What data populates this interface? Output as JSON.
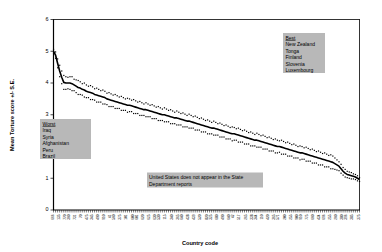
{
  "chart_data": {
    "type": "line",
    "title": "",
    "xlabel": "Country code",
    "ylabel": "Mean Torture score +/- S.E.",
    "ylim": [
      0,
      6
    ],
    "yticks": [
      0,
      1,
      2,
      3,
      4,
      5,
      6
    ],
    "grid": false,
    "legend": "none",
    "series": [
      {
        "name": "Mean Torture score",
        "values": [
          5.0,
          4.88,
          4.62,
          4.38,
          4.18,
          4.02,
          4.0,
          4.0,
          4.0,
          3.98,
          3.94,
          3.9,
          3.86,
          3.84,
          3.8,
          3.78,
          3.74,
          3.72,
          3.7,
          3.68,
          3.64,
          3.62,
          3.6,
          3.58,
          3.56,
          3.54,
          3.5,
          3.48,
          3.46,
          3.44,
          3.42,
          3.4,
          3.38,
          3.36,
          3.34,
          3.32,
          3.3,
          3.3,
          3.28,
          3.26,
          3.24,
          3.22,
          3.2,
          3.18,
          3.16,
          3.16,
          3.14,
          3.12,
          3.1,
          3.08,
          3.06,
          3.04,
          3.02,
          3.0,
          3.0,
          2.98,
          2.96,
          2.94,
          2.92,
          2.9,
          2.9,
          2.88,
          2.86,
          2.84,
          2.82,
          2.8,
          2.8,
          2.78,
          2.76,
          2.74,
          2.72,
          2.7,
          2.68,
          2.66,
          2.64,
          2.62,
          2.6,
          2.58,
          2.58,
          2.56,
          2.54,
          2.52,
          2.5,
          2.48,
          2.46,
          2.44,
          2.42,
          2.4,
          2.4,
          2.38,
          2.36,
          2.34,
          2.32,
          2.3,
          2.28,
          2.26,
          2.24,
          2.22,
          2.2,
          2.2,
          2.18,
          2.16,
          2.14,
          2.12,
          2.1,
          2.08,
          2.06,
          2.04,
          2.02,
          2.0,
          2.0,
          1.98,
          1.96,
          1.94,
          1.92,
          1.9,
          1.88,
          1.86,
          1.84,
          1.82,
          1.8,
          1.8,
          1.78,
          1.76,
          1.74,
          1.72,
          1.7,
          1.68,
          1.66,
          1.64,
          1.62,
          1.6,
          1.58,
          1.56,
          1.54,
          1.52,
          1.5,
          1.46,
          1.42,
          1.38,
          1.3,
          1.22,
          1.16,
          1.12,
          1.1,
          1.08,
          1.06,
          1.04,
          1.0,
          0.96
        ]
      }
    ],
    "error_offsets": [
      0.06,
      0.1,
      0.14,
      0.18,
      0.2,
      0.22,
      0.2,
      0.18,
      0.2,
      0.22,
      0.18,
      0.2,
      0.22,
      0.2,
      0.18,
      0.22,
      0.2,
      0.18,
      0.22,
      0.2,
      0.18,
      0.22,
      0.2,
      0.18,
      0.22,
      0.2,
      0.18,
      0.22,
      0.2,
      0.18,
      0.22,
      0.2,
      0.18,
      0.22,
      0.2,
      0.18,
      0.22,
      0.2,
      0.18,
      0.22,
      0.2,
      0.18,
      0.22,
      0.2,
      0.18,
      0.22,
      0.2,
      0.18,
      0.22,
      0.2,
      0.18,
      0.22,
      0.2,
      0.18,
      0.22,
      0.2,
      0.18,
      0.22,
      0.2,
      0.18,
      0.22,
      0.2,
      0.18,
      0.22,
      0.2,
      0.18,
      0.22,
      0.2,
      0.18,
      0.22,
      0.2,
      0.18,
      0.22,
      0.2,
      0.18,
      0.22,
      0.2,
      0.18,
      0.22,
      0.2,
      0.18,
      0.22,
      0.2,
      0.18,
      0.22,
      0.2,
      0.18,
      0.22,
      0.2,
      0.18,
      0.22,
      0.2,
      0.18,
      0.22,
      0.2,
      0.18,
      0.22,
      0.2,
      0.18,
      0.22,
      0.2,
      0.18,
      0.22,
      0.2,
      0.18,
      0.22,
      0.2,
      0.18,
      0.22,
      0.2,
      0.18,
      0.22,
      0.2,
      0.18,
      0.22,
      0.2,
      0.18,
      0.22,
      0.2,
      0.18,
      0.22,
      0.2,
      0.18,
      0.22,
      0.2,
      0.18,
      0.22,
      0.2,
      0.18,
      0.22,
      0.2,
      0.18,
      0.22,
      0.2,
      0.18,
      0.22,
      0.2,
      0.18,
      0.16,
      0.14,
      0.14,
      0.12,
      0.12,
      0.1,
      0.1,
      0.1,
      0.08,
      0.08,
      0.08,
      0.06
    ],
    "xtick_labels": [
      "666",
      "135",
      "770",
      "360",
      "731",
      "70",
      "475",
      "345",
      "490",
      "910",
      "41",
      "560",
      "375",
      "101",
      "600",
      "601",
      "620",
      "625",
      "630",
      "530",
      "115",
      "340",
      "365",
      "640",
      "438",
      "439",
      "520",
      "820",
      "325",
      "680",
      "490",
      "640",
      "42",
      "517",
      "265",
      "338",
      "344",
      "110",
      "420",
      "365",
      "571",
      "200",
      "255",
      "900",
      "910",
      "775",
      "660",
      "434",
      "696",
      "255",
      "260",
      "380",
      "396",
      "385",
      "375"
    ]
  },
  "annotations": {
    "worst": {
      "header": "Worst",
      "items": [
        "Iraq",
        "Syria",
        "Afghanistan",
        "Peru",
        "Brazil"
      ]
    },
    "best": {
      "header": "Best",
      "items": [
        "New Zealand",
        "Tonga",
        "Finland",
        "Slovenia",
        "Luxembourg"
      ]
    },
    "note": {
      "line1": "United States does not appear in the State",
      "line2": "Department reports"
    }
  }
}
